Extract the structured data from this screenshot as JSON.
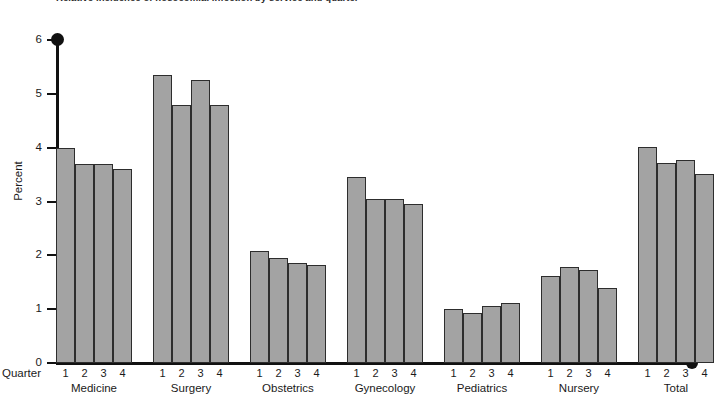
{
  "figure": {
    "title": "Relative incidence of nosocomial infection by service and quarter",
    "y_axis_title": "Percent",
    "quarter_axis_label": "Quarter",
    "bar_fill_color": "#a3a3a3",
    "bar_edge_color": "#2d2d2d",
    "axis_color": "#111111"
  },
  "chart_data": {
    "type": "bar",
    "title": "Relative incidence of nosocomial infection by service and quarter",
    "xlabel": "Quarter",
    "ylabel": "Percent",
    "ylim": [
      0,
      6
    ],
    "yticks": [
      0,
      1,
      2,
      3,
      4,
      5,
      6
    ],
    "ytick_labels": [
      "0",
      "1",
      "2",
      "3",
      "4",
      "5",
      "6"
    ],
    "grid": false,
    "legend": "none",
    "categories": [
      "Medicine",
      "Surgery",
      "Obstetrics",
      "Gynecology",
      "Pediatrics",
      "Nursery",
      "Total"
    ],
    "subcategories": [
      "1",
      "2",
      "3",
      "4"
    ],
    "groups": [
      {
        "name": "Medicine",
        "quarters": [
          "1",
          "2",
          "3",
          "4"
        ],
        "values": [
          4.0,
          3.7,
          3.7,
          3.6
        ]
      },
      {
        "name": "Surgery",
        "quarters": [
          "1",
          "2",
          "3",
          "4"
        ],
        "values": [
          5.35,
          4.8,
          5.25,
          4.8
        ]
      },
      {
        "name": "Obstetrics",
        "quarters": [
          "1",
          "2",
          "3",
          "4"
        ],
        "values": [
          2.08,
          1.95,
          1.85,
          1.82
        ]
      },
      {
        "name": "Gynecology",
        "quarters": [
          "1",
          "2",
          "3",
          "4"
        ],
        "values": [
          3.45,
          3.05,
          3.05,
          2.95
        ]
      },
      {
        "name": "Pediatrics",
        "quarters": [
          "1",
          "2",
          "3",
          "4"
        ],
        "values": [
          1.0,
          0.92,
          1.05,
          1.12
        ]
      },
      {
        "name": "Nursery",
        "quarters": [
          "1",
          "2",
          "3",
          "4"
        ],
        "values": [
          1.62,
          1.78,
          1.72,
          1.4
        ]
      },
      {
        "name": "Total",
        "quarters": [
          "1",
          "2",
          "3",
          "4"
        ],
        "values": [
          4.02,
          3.72,
          3.78,
          3.52
        ]
      }
    ]
  }
}
